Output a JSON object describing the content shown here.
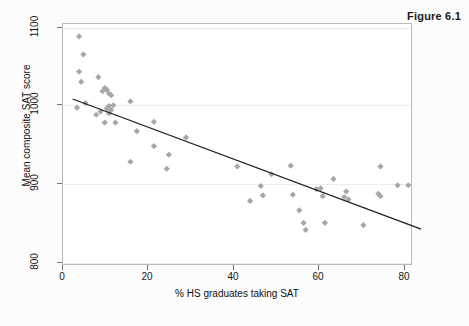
{
  "figure": {
    "title": "Figure 6.1"
  },
  "chart_data": {
    "type": "scatter",
    "title": "Figure 6.1",
    "xlabel": "% HS graduates taking SAT",
    "ylabel": "Mean composite SAT score",
    "xlim": [
      0,
      82
    ],
    "ylim": [
      790,
      1110
    ],
    "xticks": [
      0,
      20,
      40,
      60,
      80
    ],
    "xtick_labels": [
      "0",
      "20",
      "40",
      "60",
      "80"
    ],
    "yticks": [
      800,
      900,
      1000,
      1100
    ],
    "ytick_labels": [
      "800",
      "900",
      "1000",
      "1100"
    ],
    "grid": "horizontal",
    "legend": "none",
    "marker": {
      "shape": "diamond",
      "color": "#a7a7a7",
      "size": 5
    },
    "points": [
      {
        "x": 4.0,
        "y": 1088
      },
      {
        "x": 5.0,
        "y": 1065
      },
      {
        "x": 4.0,
        "y": 1043
      },
      {
        "x": 4.5,
        "y": 1030
      },
      {
        "x": 8.5,
        "y": 1036
      },
      {
        "x": 3.5,
        "y": 997
      },
      {
        "x": 5.5,
        "y": 1003
      },
      {
        "x": 9.5,
        "y": 1018
      },
      {
        "x": 10.0,
        "y": 1022
      },
      {
        "x": 10.5,
        "y": 1020
      },
      {
        "x": 11.0,
        "y": 1015
      },
      {
        "x": 11.5,
        "y": 1013
      },
      {
        "x": 8.0,
        "y": 988
      },
      {
        "x": 9.0,
        "y": 992
      },
      {
        "x": 10.5,
        "y": 996
      },
      {
        "x": 11.0,
        "y": 999
      },
      {
        "x": 11.5,
        "y": 994
      },
      {
        "x": 11.0,
        "y": 990
      },
      {
        "x": 12.0,
        "y": 1000
      },
      {
        "x": 10.0,
        "y": 978
      },
      {
        "x": 12.5,
        "y": 978
      },
      {
        "x": 16.0,
        "y": 1005
      },
      {
        "x": 17.5,
        "y": 967
      },
      {
        "x": 21.5,
        "y": 979
      },
      {
        "x": 21.5,
        "y": 948
      },
      {
        "x": 16.0,
        "y": 928
      },
      {
        "x": 24.5,
        "y": 919
      },
      {
        "x": 25.0,
        "y": 937
      },
      {
        "x": 29.0,
        "y": 959
      },
      {
        "x": 41.0,
        "y": 922
      },
      {
        "x": 44.0,
        "y": 878
      },
      {
        "x": 46.5,
        "y": 897
      },
      {
        "x": 47.0,
        "y": 885
      },
      {
        "x": 49.0,
        "y": 912
      },
      {
        "x": 53.5,
        "y": 923
      },
      {
        "x": 54.0,
        "y": 886
      },
      {
        "x": 55.5,
        "y": 866
      },
      {
        "x": 56.5,
        "y": 850
      },
      {
        "x": 57.0,
        "y": 841
      },
      {
        "x": 59.5,
        "y": 893
      },
      {
        "x": 60.5,
        "y": 894
      },
      {
        "x": 61.0,
        "y": 884
      },
      {
        "x": 61.5,
        "y": 850
      },
      {
        "x": 63.5,
        "y": 906
      },
      {
        "x": 66.0,
        "y": 883
      },
      {
        "x": 66.5,
        "y": 890
      },
      {
        "x": 67.0,
        "y": 880
      },
      {
        "x": 70.5,
        "y": 847
      },
      {
        "x": 74.0,
        "y": 887
      },
      {
        "x": 74.5,
        "y": 884
      },
      {
        "x": 74.5,
        "y": 922
      },
      {
        "x": 78.5,
        "y": 898
      },
      {
        "x": 81.0,
        "y": 898
      }
    ],
    "fit_line": {
      "type": "linear",
      "x_start": 2.5,
      "y_start": 1008,
      "x_end": 84.0,
      "y_end": 842
    }
  }
}
